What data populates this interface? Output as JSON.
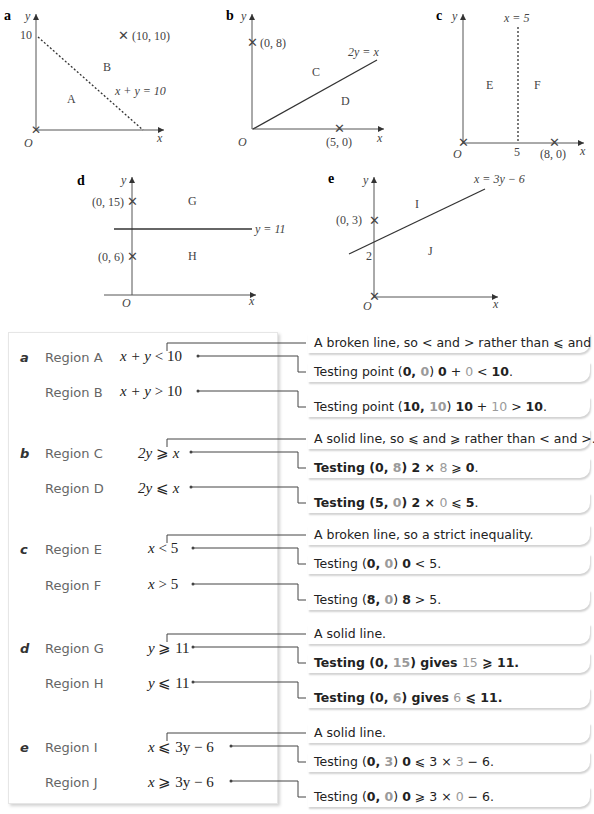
{
  "graphs": {
    "a": {
      "label": "a",
      "y_axis": "y",
      "x_axis": "x",
      "origin": "O",
      "y_tick": "10",
      "point": "(10, 10)",
      "line_label": "x + y = 10",
      "line_style": "dashed",
      "regions": [
        "A",
        "B"
      ]
    },
    "b": {
      "label": "b",
      "y_axis": "y",
      "x_axis": "x",
      "origin": "O",
      "point1": "(0, 8)",
      "point2": "(5, 0)",
      "line_label": "2y = x",
      "line_style": "solid",
      "regions": [
        "C",
        "D"
      ]
    },
    "c": {
      "label": "c",
      "y_axis": "y",
      "x_axis": "x",
      "origin": "O",
      "x_tick": "5",
      "point": "(8, 0)",
      "line_label": "x = 5",
      "line_style": "dashed",
      "regions": [
        "E",
        "F"
      ]
    },
    "d": {
      "label": "d",
      "y_axis": "y",
      "x_axis": "x",
      "origin": "O",
      "point1": "(0, 15)",
      "point2": "(0, 6)",
      "line_label": "y = 11",
      "line_style": "solid",
      "regions": [
        "G",
        "H"
      ]
    },
    "e": {
      "label": "e",
      "y_axis": "y",
      "x_axis": "x",
      "origin": "O",
      "y_tick": "2",
      "point": "(0, 3)",
      "line_label": "x = 3y − 6",
      "line_style": "solid",
      "regions": [
        "I",
        "J"
      ]
    }
  },
  "answers": [
    {
      "part": "a",
      "rows": [
        {
          "region": "Region A",
          "lhs": "x + y",
          "op": "<",
          "rhs": "10"
        },
        {
          "region": "Region B",
          "lhs": "x + y",
          "op": ">",
          "rhs": "10"
        }
      ]
    },
    {
      "part": "b",
      "rows": [
        {
          "region": "Region C",
          "lhs": "2y",
          "op": "⩾",
          "rhs": "x"
        },
        {
          "region": "Region D",
          "lhs": "2y",
          "op": "⩽",
          "rhs": "x"
        }
      ]
    },
    {
      "part": "c",
      "rows": [
        {
          "region": "Region E",
          "lhs": "x",
          "op": "<",
          "rhs": "5"
        },
        {
          "region": "Region F",
          "lhs": "x",
          "op": ">",
          "rhs": "5"
        }
      ]
    },
    {
      "part": "d",
      "rows": [
        {
          "region": "Region G",
          "lhs": "y",
          "op": "⩾",
          "rhs": "11"
        },
        {
          "region": "Region H",
          "lhs": "y",
          "op": "⩽",
          "rhs": "11"
        }
      ]
    },
    {
      "part": "e",
      "rows": [
        {
          "region": "Region I",
          "lhs": "x",
          "op": "⩽",
          "rhs": "3y − 6"
        },
        {
          "region": "Region J",
          "lhs": "x",
          "op": "⩾",
          "rhs": "3y − 6"
        }
      ]
    }
  ],
  "notes": {
    "a_line": "A broken line, so < and > rather than ⩽ and ⩾.",
    "a_test1": {
      "pre": "Testing point (",
      "x": "0",
      "sep": ", ",
      "y": "0",
      "post": ") ",
      "e1": "0",
      "e2": " + ",
      "e3": "0",
      "e4": " < ",
      "e5": "10",
      "end": "."
    },
    "a_test2": {
      "pre": "Testing point (",
      "x": "10",
      "sep": ", ",
      "y": "10",
      "post": ") ",
      "e1": "10",
      "e2": " + ",
      "e3": "10",
      "e4": " > ",
      "e5": "10",
      "end": "."
    },
    "b_line": "A solid line, so ⩽ and ⩾ rather than < and >.",
    "b_test1": {
      "pre": "Testing (0, ",
      "y": "8",
      "post": ") 2 × ",
      "v": "8",
      "rest": " ⩾ ",
      "end_b": "0",
      "end": "."
    },
    "b_test2": {
      "pre": "Testing (5, ",
      "y": "0",
      "post": ") 2 × ",
      "v": "0",
      "rest": " ⩽ ",
      "end_b": "5",
      "end": "."
    },
    "c_line": "A broken line, so a strict inequality.",
    "c_test1": {
      "pre": "Testing (",
      "x": "0",
      "sep": ", ",
      "y": "0",
      "post": ") ",
      "b": "0",
      "rest": " < 5."
    },
    "c_test2": {
      "pre": "Testing (",
      "x": "8",
      "sep": ", ",
      "y": "0",
      "post": ") ",
      "b": "8",
      "rest": " > 5."
    },
    "d_line": "A solid line.",
    "d_test1": {
      "pre": "Testing (0, ",
      "y": "15",
      "post": ") gives ",
      "v": "15",
      "rest": " ⩾ 11."
    },
    "d_test2": {
      "pre": "Testing (0, ",
      "y": "6",
      "post": ") gives ",
      "v": "6",
      "rest": " ⩽ 11."
    },
    "e_line": "A solid line.",
    "e_test1": {
      "pre": "Testing (",
      "x": "0",
      "sep": ", ",
      "y": "3",
      "post": ") ",
      "b": "0",
      "mid": " ⩽ 3 × ",
      "v": "3",
      "rest": " − 6."
    },
    "e_test2": {
      "pre": "Testing (",
      "x": "0",
      "sep": ", ",
      "y": "0",
      "post": ") ",
      "b": "0",
      "mid": " ⩾ 3 × ",
      "v": "0",
      "rest": " − 6."
    }
  },
  "colors": {
    "highlight_grey": "#9a9a9a",
    "text": "#222222",
    "region_text": "#666666"
  }
}
